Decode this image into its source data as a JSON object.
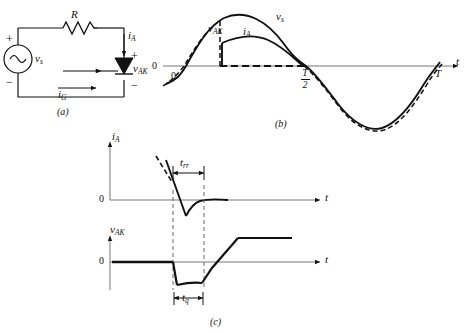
{
  "figure": {
    "background_color": "#ffffff",
    "line_color": "#111111",
    "axis_color": "#555555"
  },
  "panel_a": {
    "caption": "(a)",
    "name": "scr-half-wave-rectifier-circuit",
    "components": {
      "resistor_label": "R",
      "source_label": "v",
      "source_sub": "s",
      "source_type": "ac-sine",
      "thyristor": "SCR",
      "anode_current_label": "i",
      "anode_current_sub": "A",
      "gate_current_label": "i",
      "gate_current_sub": "G",
      "device_voltage_label": "v",
      "device_voltage_sub": "AK"
    },
    "polarity": {
      "source_plus": "+",
      "source_minus": "−",
      "device_plus": "+",
      "device_minus": "−"
    }
  },
  "panel_b": {
    "caption": "(b)",
    "name": "ac-source-and-load-current-waveforms",
    "axis": {
      "x_label": "t",
      "origin_label": "0",
      "left_zero_label": "0",
      "ticks": [
        {
          "label_num": "T",
          "label_den": "2",
          "type": "fraction"
        },
        {
          "label": "T",
          "type": "plain"
        }
      ]
    },
    "traces": [
      {
        "name": "source-voltage",
        "label": "v",
        "sub": "s",
        "style": "solid"
      },
      {
        "name": "anode-current",
        "label": "i",
        "sub": "A",
        "style": "solid"
      },
      {
        "name": "device-voltage",
        "label": "v",
        "sub": "AK",
        "style": "dashed"
      }
    ]
  },
  "panel_c": {
    "caption": "(c)",
    "name": "reverse-recovery-and-turn-off-waveforms",
    "top_plot": {
      "y_label": "i",
      "y_sub": "A",
      "x_label": "t",
      "zero_label": "0",
      "interval_label": "t",
      "interval_sub": "rr"
    },
    "bottom_plot": {
      "y_label": "v",
      "y_sub": "AK",
      "x_label": "t",
      "zero_label": "0",
      "interval_label": "t",
      "interval_sub": "q"
    }
  }
}
